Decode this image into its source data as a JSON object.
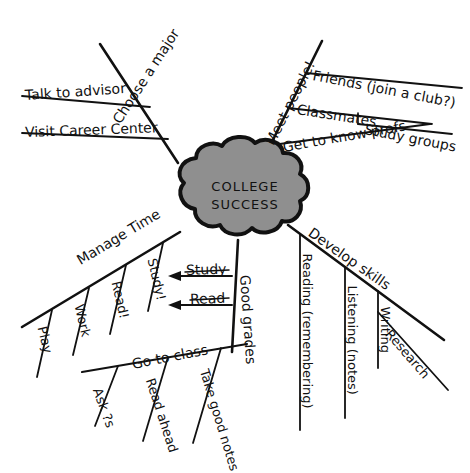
{
  "diagram": {
    "type": "mind-map",
    "background_color": "#ffffff",
    "ink_color": "#111111",
    "cloud_fill_color": "#8f8f8f",
    "cloud_stroke_color": "#111111"
  },
  "center": {
    "line1": "COLLEGE",
    "line2": "SUCCESS"
  },
  "branches": {
    "choose_a_major": {
      "label": "Choose a major",
      "children": [
        {
          "label": "Talk to advisor"
        },
        {
          "label": "Visit Career Center"
        }
      ]
    },
    "meet_people": {
      "label": "Meet people!",
      "children": [
        {
          "label": "Friends (join a club?)"
        },
        {
          "label": "Classmates"
        },
        {
          "label": "Study groups"
        },
        {
          "label": "Get to know profs"
        }
      ]
    },
    "develop_skills": {
      "label": "Develop skills",
      "children": [
        {
          "label": "Reading (remembering)"
        },
        {
          "label": "Listening (notes)"
        },
        {
          "label": "Writing"
        },
        {
          "label": "Research"
        }
      ]
    },
    "good_grades": {
      "label": "Good grades",
      "children": [
        {
          "label": "Go to class"
        },
        {
          "label": "Ask ?s"
        },
        {
          "label": "Read ahead"
        },
        {
          "label": "Take good notes"
        }
      ]
    },
    "manage_time": {
      "label": "Manage Time",
      "children": [
        {
          "label": "Play"
        },
        {
          "label": "Work"
        },
        {
          "label": "Read!"
        },
        {
          "label": "Study!"
        }
      ]
    }
  },
  "arrows": [
    {
      "label": "Study",
      "direction": "left"
    },
    {
      "label": "Read",
      "direction": "left"
    }
  ]
}
